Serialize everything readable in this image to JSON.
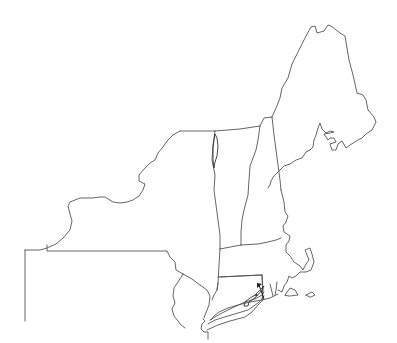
{
  "map": {
    "title": "Northeastern United States outline map",
    "region": "New England, New York, New Jersey and Pennsylvania (partial)",
    "labels_visible": false,
    "stroke_color": "#555555",
    "background_color": "#ffffff",
    "features": [
      {
        "id": "maine",
        "name": "Maine"
      },
      {
        "id": "new-hampshire",
        "name": "New Hampshire"
      },
      {
        "id": "vermont",
        "name": "Vermont"
      },
      {
        "id": "massachusetts",
        "name": "Massachusetts"
      },
      {
        "id": "rhode-island",
        "name": "Rhode Island"
      },
      {
        "id": "connecticut",
        "name": "Connecticut"
      },
      {
        "id": "new-york",
        "name": "New York"
      },
      {
        "id": "new-jersey",
        "name": "New Jersey"
      },
      {
        "id": "pennsylvania",
        "name": "Pennsylvania"
      },
      {
        "id": "long-island",
        "name": "Long Island"
      },
      {
        "id": "lake-champlain",
        "name": "Lake Champlain"
      },
      {
        "id": "cape-cod",
        "name": "Cape Cod"
      },
      {
        "id": "marthas-vineyard",
        "name": "Martha's Vineyard"
      },
      {
        "id": "nantucket",
        "name": "Nantucket"
      }
    ],
    "annotation": {
      "type": "arrow",
      "points_to": "eastern tip of Long Island"
    }
  }
}
